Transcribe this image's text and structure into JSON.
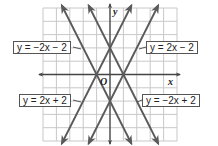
{
  "diagram": {
    "type": "coordinate-plane-graph",
    "grid": {
      "x_min": -5,
      "x_max": 5,
      "y_min": -5,
      "y_max": 5,
      "step": 1
    },
    "axes": {
      "x_label": "x",
      "y_label": "y",
      "origin_label": "O"
    },
    "colors": {
      "grid": "#c8c8c8",
      "axis": "#555555",
      "line": "#5a5a5a",
      "label_border": "#555555"
    },
    "lines": [
      {
        "equation": "y = −2x − 2",
        "slope": -2,
        "intercept": -2,
        "label_position": "upper-left"
      },
      {
        "equation": "y = 2x − 2",
        "slope": 2,
        "intercept": -2,
        "label_position": "upper-right"
      },
      {
        "equation": "y = 2x + 2",
        "slope": 2,
        "intercept": 2,
        "label_position": "lower-left"
      },
      {
        "equation": "y = −2x + 2",
        "slope": -2,
        "intercept": 2,
        "label_position": "lower-right"
      }
    ]
  }
}
